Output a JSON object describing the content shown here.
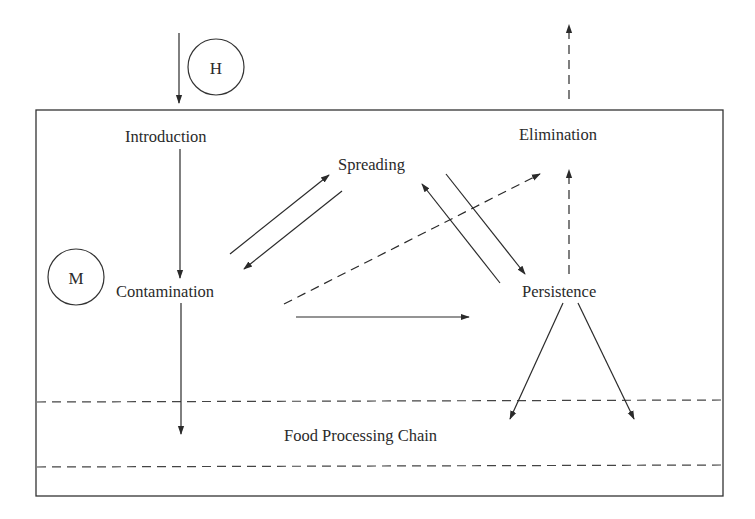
{
  "diagram": {
    "nodes": {
      "introduction": "Introduction",
      "contamination": "Contamination",
      "spreading": "Spreading",
      "persistence": "Persistence",
      "elimination": "Elimination",
      "food_processing_chain": "Food Processing Chain"
    },
    "markers": {
      "h": "H",
      "m": "M"
    },
    "edges": [
      {
        "from": "outside",
        "to": "introduction",
        "style": "solid",
        "marker": "H"
      },
      {
        "from": "introduction",
        "to": "contamination",
        "style": "solid"
      },
      {
        "from": "contamination",
        "to": "spreading",
        "style": "solid"
      },
      {
        "from": "spreading",
        "to": "contamination",
        "style": "solid"
      },
      {
        "from": "contamination",
        "to": "elimination",
        "style": "dashed"
      },
      {
        "from": "contamination",
        "to": "persistence",
        "style": "solid"
      },
      {
        "from": "spreading",
        "to": "persistence",
        "style": "solid"
      },
      {
        "from": "persistence",
        "to": "spreading",
        "style": "solid"
      },
      {
        "from": "persistence",
        "to": "elimination",
        "style": "dashed"
      },
      {
        "from": "elimination",
        "to": "outside",
        "style": "dashed"
      },
      {
        "from": "contamination",
        "to": "food_processing_chain",
        "style": "solid"
      },
      {
        "from": "persistence",
        "to": "food_processing_chain",
        "style": "solid"
      },
      {
        "from": "persistence",
        "to": "food_processing_chain",
        "style": "solid"
      }
    ],
    "colors": {
      "stroke": "#2a2a2a",
      "background": "#ffffff"
    }
  }
}
